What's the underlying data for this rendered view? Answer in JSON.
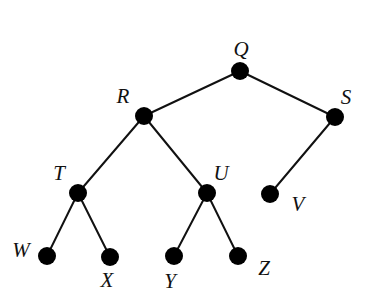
{
  "diagram": {
    "type": "tree",
    "node_color": "#000000",
    "edge_color": "#111111",
    "nodes": [
      {
        "id": "Q",
        "label": "Q",
        "x": 240,
        "y": 71,
        "lx": 241,
        "ly": 56
      },
      {
        "id": "R",
        "label": "R",
        "x": 144,
        "y": 116,
        "lx": 123,
        "ly": 103
      },
      {
        "id": "S",
        "label": "S",
        "x": 335,
        "y": 117,
        "lx": 346,
        "ly": 104
      },
      {
        "id": "T",
        "label": "T",
        "x": 78,
        "y": 193,
        "lx": 59,
        "ly": 180
      },
      {
        "id": "U",
        "label": "U",
        "x": 207,
        "y": 193,
        "lx": 221,
        "ly": 180
      },
      {
        "id": "V",
        "label": "V",
        "x": 270,
        "y": 194,
        "lx": 298,
        "ly": 211
      },
      {
        "id": "W",
        "label": "W",
        "x": 47,
        "y": 256,
        "lx": 21,
        "ly": 257
      },
      {
        "id": "X",
        "label": "X",
        "x": 110,
        "y": 257,
        "lx": 107,
        "ly": 287
      },
      {
        "id": "Y",
        "label": "Y",
        "x": 174,
        "y": 256,
        "lx": 170,
        "ly": 288
      },
      {
        "id": "Z",
        "label": "Z",
        "x": 238,
        "y": 256,
        "lx": 264,
        "ly": 275
      }
    ],
    "edges": [
      {
        "from": "Q",
        "to": "R"
      },
      {
        "from": "Q",
        "to": "S"
      },
      {
        "from": "R",
        "to": "T"
      },
      {
        "from": "R",
        "to": "U"
      },
      {
        "from": "S",
        "to": "V"
      },
      {
        "from": "T",
        "to": "W"
      },
      {
        "from": "T",
        "to": "X"
      },
      {
        "from": "U",
        "to": "Y"
      },
      {
        "from": "U",
        "to": "Z"
      }
    ]
  }
}
